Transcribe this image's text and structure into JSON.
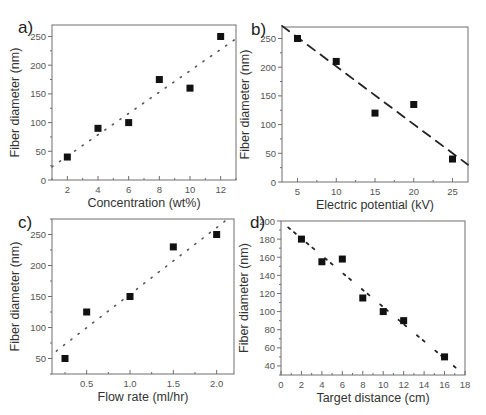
{
  "chart_data": [
    {
      "panel": "a)",
      "type": "scatter",
      "title": "",
      "xlabel": "Concentration (wt%)",
      "ylabel": "Fiber diameter (nm)",
      "xlim": [
        1,
        13
      ],
      "ylim": [
        0,
        270
      ],
      "xticks": [
        2,
        4,
        6,
        8,
        10,
        12
      ],
      "yticks": [
        0,
        50,
        100,
        150,
        200,
        250
      ],
      "grid": false,
      "legend": null,
      "points": {
        "x": [
          2,
          4,
          6,
          8,
          10,
          12
        ],
        "y": [
          40,
          90,
          100,
          175,
          160,
          250
        ]
      },
      "fit": {
        "style": "dotted",
        "x": [
          1,
          13
        ],
        "y": [
          23,
          246
        ]
      },
      "frame": {
        "left": 52,
        "right": 236,
        "top": 25,
        "bottom": 180
      },
      "label_pos": {
        "x": 18,
        "y": 33
      }
    },
    {
      "panel": "b)",
      "type": "scatter",
      "title": "",
      "xlabel": "Electric potential (kV)",
      "ylabel": "Fiber diameter (nm)",
      "xlim": [
        3,
        27
      ],
      "ylim": [
        0,
        270
      ],
      "xticks": [
        5,
        10,
        15,
        20,
        25
      ],
      "yticks": [
        0,
        50,
        100,
        150,
        200,
        250
      ],
      "grid": false,
      "legend": null,
      "points": {
        "x": [
          5,
          10,
          15,
          20,
          25
        ],
        "y": [
          250,
          210,
          120,
          135,
          40
        ]
      },
      "fit": {
        "style": "dashed",
        "x": [
          3,
          27
        ],
        "y": [
          272,
          30
        ]
      },
      "frame": {
        "left": 282,
        "right": 468,
        "top": 27,
        "bottom": 182
      },
      "label_pos": {
        "x": 251,
        "y": 35
      }
    },
    {
      "panel": "c)",
      "type": "scatter",
      "title": "",
      "xlabel": "Flow rate (ml/hr)",
      "ylabel": "Fiber diameter (nm)",
      "xlim": [
        0.1,
        2.2
      ],
      "ylim": [
        25,
        275
      ],
      "xticks": [
        0.5,
        1.0,
        1.5,
        2.0
      ],
      "xticklabels": [
        "0.5",
        "1.0",
        "1.5",
        "2.0"
      ],
      "yticks": [
        50,
        100,
        150,
        200,
        250
      ],
      "grid": false,
      "legend": null,
      "points": {
        "x": [
          0.25,
          0.5,
          1.0,
          1.5,
          2.0
        ],
        "y": [
          50,
          125,
          150,
          230,
          250
        ]
      },
      "fit": {
        "style": "dotted",
        "x": [
          0.15,
          2.1
        ],
        "y": [
          62,
          272
        ]
      },
      "frame": {
        "left": 52,
        "right": 234,
        "top": 219,
        "bottom": 374
      },
      "label_pos": {
        "x": 18,
        "y": 228
      }
    },
    {
      "panel": "d)",
      "type": "scatter",
      "title": "",
      "xlabel": "Target distance (cm)",
      "ylabel": "Fiber diameter (nm)",
      "xlim": [
        0,
        18
      ],
      "ylim": [
        30,
        200
      ],
      "xticks": [
        0,
        2,
        4,
        6,
        8,
        10,
        12,
        14,
        16,
        18
      ],
      "yticks": [
        40,
        60,
        80,
        100,
        120,
        140,
        160,
        180,
        200
      ],
      "grid": false,
      "legend": null,
      "points": {
        "x": [
          2,
          4,
          6,
          8,
          10,
          12,
          16
        ],
        "y": [
          180,
          155,
          158,
          115,
          100,
          90,
          50
        ]
      },
      "fit": {
        "style": "dashdot-short",
        "x": [
          0.7,
          17.2
        ],
        "y": [
          193,
          37
        ]
      },
      "frame": {
        "left": 281,
        "right": 465,
        "top": 221,
        "bottom": 375
      },
      "label_pos": {
        "x": 250,
        "y": 228
      }
    }
  ]
}
